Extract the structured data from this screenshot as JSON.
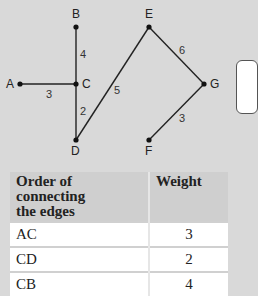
{
  "graph": {
    "nodes": [
      {
        "id": "A",
        "x": 20,
        "y": 84,
        "label_dx": -14,
        "label_dy": 4
      },
      {
        "id": "B",
        "x": 76,
        "y": 27,
        "label_dx": -4,
        "label_dy": -9
      },
      {
        "id": "C",
        "x": 76,
        "y": 84,
        "label_dx": 6,
        "label_dy": 4
      },
      {
        "id": "D",
        "x": 76,
        "y": 140,
        "label_dx": -5,
        "label_dy": 15
      },
      {
        "id": "E",
        "x": 149,
        "y": 27,
        "label_dx": -4,
        "label_dy": -9
      },
      {
        "id": "F",
        "x": 149,
        "y": 140,
        "label_dx": -4,
        "label_dy": 15
      },
      {
        "id": "G",
        "x": 204,
        "y": 84,
        "label_dx": 6,
        "label_dy": 4
      }
    ],
    "edges": [
      {
        "from": "A",
        "to": "C",
        "weight": "3",
        "lx": 46,
        "ly": 98
      },
      {
        "from": "B",
        "to": "C",
        "weight": "4",
        "lx": 80,
        "ly": 58
      },
      {
        "from": "C",
        "to": "D",
        "weight": "2",
        "lx": 80,
        "ly": 115
      },
      {
        "from": "D",
        "to": "E",
        "weight": "5",
        "lx": 114,
        "ly": 94
      },
      {
        "from": "E",
        "to": "G",
        "weight": "6",
        "lx": 179,
        "ly": 54
      },
      {
        "from": "F",
        "to": "G",
        "weight": "3",
        "lx": 179,
        "ly": 122
      }
    ]
  },
  "table": {
    "headers": [
      "Order of connecting the edges",
      "Weight"
    ],
    "header_line1": "Order of connecting",
    "header_line2": "the edges",
    "rows": [
      {
        "edge": "AC",
        "weight": "3"
      },
      {
        "edge": "CD",
        "weight": "2"
      },
      {
        "edge": "CB",
        "weight": "4"
      }
    ]
  }
}
